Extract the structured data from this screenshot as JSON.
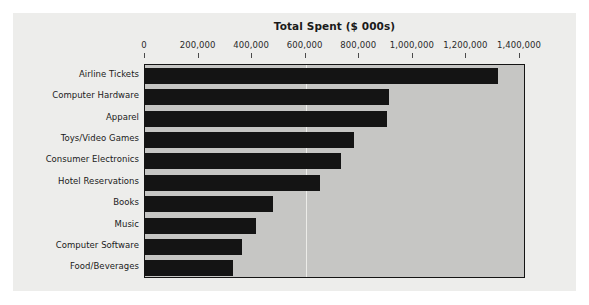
{
  "chart_data": {
    "type": "bar",
    "orientation": "horizontal",
    "title": "Total Spent ($ 000s)",
    "xlabel": "",
    "ylabel": "",
    "xlim": [
      0,
      1400000
    ],
    "grid": true,
    "gridlines_at": [
      600000
    ],
    "legend": null,
    "tick_labels": [
      "0",
      "200,000",
      "400,000",
      "600,000",
      "800,000",
      "1,000,000",
      "1,200,000",
      "1,400,000"
    ],
    "ticks": [
      0,
      200000,
      400000,
      600000,
      800000,
      1000000,
      1200000,
      1400000
    ],
    "categories": [
      "Airline Tickets",
      "Computer Hardware",
      "Apparel",
      "Toys/Video Games",
      "Consumer Electronics",
      "Hotel Reservations",
      "Books",
      "Music",
      "Computer Software",
      "Food/Beverages"
    ],
    "values": [
      1318000,
      910000,
      903000,
      780000,
      731000,
      653000,
      478000,
      414000,
      362000,
      328000
    ],
    "colors": {
      "bar": "#141414",
      "plot_background": "#c6c6c4",
      "canvas_background": "#ededeb",
      "page_background": "#ffffff",
      "axis_border": "#141414",
      "gridline": "#f2f2f0",
      "text": "#1a1a1a"
    }
  }
}
